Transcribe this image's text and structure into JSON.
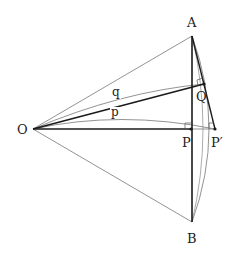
{
  "diagram": {
    "points": {
      "O": {
        "label": "O",
        "x": 33,
        "y": 129
      },
      "A": {
        "label": "A",
        "x": 192,
        "y": 36
      },
      "B": {
        "label": "B",
        "x": 192,
        "y": 222
      },
      "P": {
        "label": "P",
        "x": 191,
        "y": 129
      },
      "P_prime": {
        "label": "P′",
        "x": 215,
        "y": 129
      },
      "Q": {
        "label": "Q",
        "x": 204,
        "y": 84
      }
    },
    "arc_labels": {
      "p": "p",
      "q": "q"
    },
    "colors": {
      "thick_line": "#1a1a1a",
      "thin_line": "#777777",
      "label": "#222222"
    }
  }
}
